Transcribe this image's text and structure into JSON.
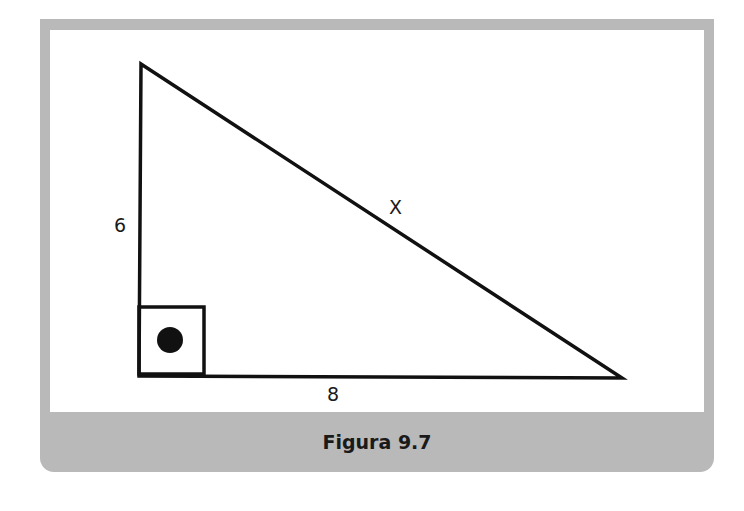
{
  "figure": {
    "caption": "Figura 9.7",
    "colors": {
      "frame": "#b9b9b9",
      "background": "#ffffff",
      "stroke": "#111111"
    },
    "triangle": {
      "type": "right-triangle",
      "vertices": {
        "top": [
          141,
          64
        ],
        "right_angle": [
          139,
          376
        ],
        "right": [
          622,
          378
        ]
      },
      "right_angle_marker": "square-with-dot"
    },
    "labels": {
      "vertical_leg": "6",
      "hypotenuse": "X",
      "horizontal_leg": "8"
    }
  }
}
